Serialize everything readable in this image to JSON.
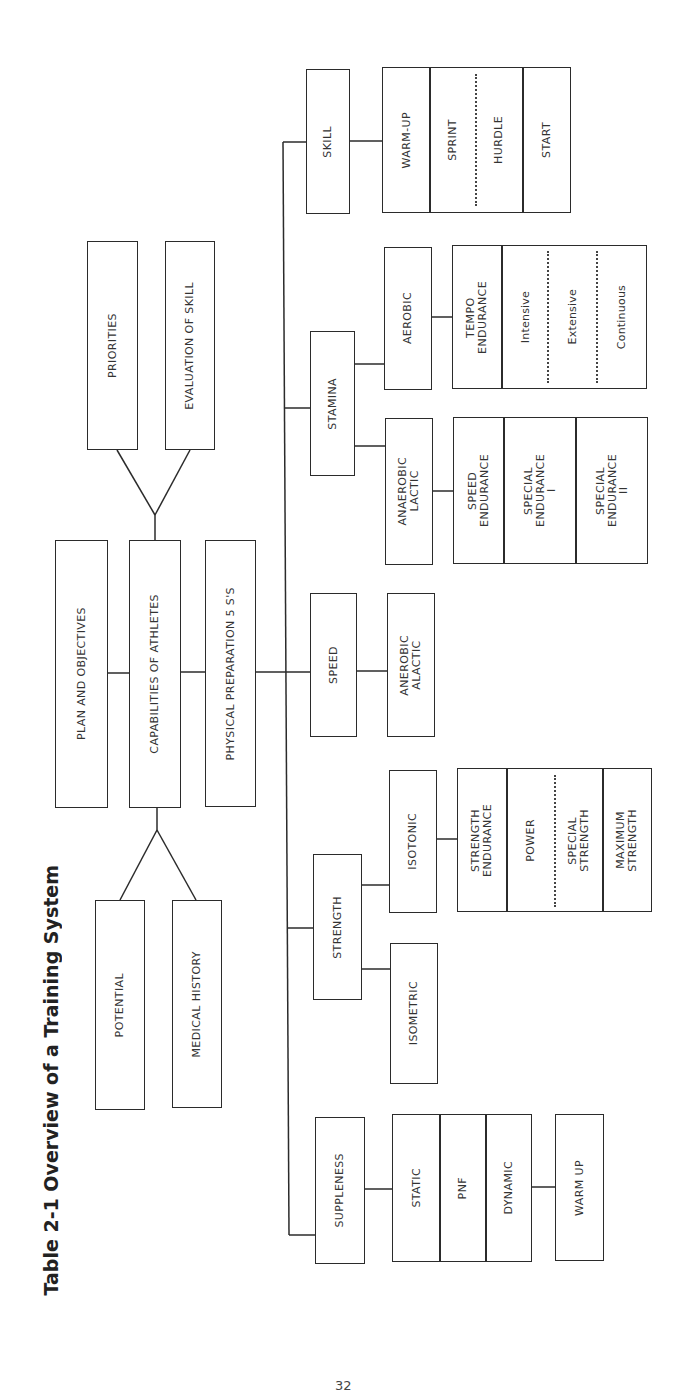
{
  "title": "Table 2-1 Overview of a Training System",
  "page_number": "32",
  "top_level": {
    "plan": "PLAN AND OBJECTIVES",
    "capabilities": "CAPABILITIES OF ATHLETES",
    "physical_prep": "PHYSICAL PREPARATION 5 S'S",
    "capabilities_inputs_upper": [
      "PRIORITIES",
      "EVALUATION OF SKILL"
    ],
    "capabilities_inputs_lower": [
      "POTENTIAL",
      "MEDICAL HISTORY"
    ]
  },
  "branches": {
    "skill": {
      "label": "SKILL",
      "components": [
        "WARM-UP",
        "SPRINT",
        "HURDLE",
        "START"
      ]
    },
    "stamina": {
      "label": "STAMINA",
      "aerobic": {
        "label": "AEROBIC",
        "tempo": "TEMPO\nENDURANCE",
        "types": [
          "Intensive",
          "Extensive",
          "Continuous"
        ]
      },
      "anaerobic_lactic": {
        "label": "ANAEROBIC\nLACTIC",
        "types": [
          "SPEED\nENDURANCE",
          "SPECIAL\nENDURANCE\nI",
          "SPECIAL\nENDURANCE\nII"
        ]
      }
    },
    "speed": {
      "label": "SPEED",
      "sub": "ANEROBIC\nALACTIC"
    },
    "strength": {
      "label": "STRENGTH",
      "isotonic": {
        "label": "ISOTONIC",
        "types": [
          "STRENGTH\nENDURANCE",
          "POWER",
          "SPECIAL\nSTRENGTH",
          "MAXIMUM\nSTRENGTH"
        ]
      },
      "isometric": "ISOMETRIC"
    },
    "suppleness": {
      "label": "SUPPLENESS",
      "types": [
        "STATIC",
        "PNF",
        "DYNAMIC"
      ],
      "warm_up": "WARM UP"
    }
  }
}
